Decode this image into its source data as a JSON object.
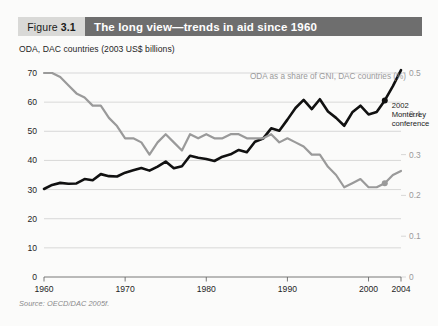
{
  "figure": {
    "number_prefix": "Figure",
    "number": "3.1",
    "title": "The long view—trends in aid since 1960",
    "subtitle": "ODA, DAC countries (2003 US$ billions)",
    "source": "Source: OECD/DAC 2005f.",
    "header_box_color": "#d9d9d7",
    "header_bar_color": "#6e6e6e",
    "header_text_color": "#ffffff"
  },
  "chart_data": {
    "type": "line",
    "title": "The long view—trends in aid since 1960",
    "xlabel": "",
    "ylabel": "ODA, DAC countries (2003 US$ billions)",
    "y2label": "ODA as a share of GNI, DAC countries (%)",
    "xlim": [
      1960,
      2004
    ],
    "ylim": [
      0,
      70
    ],
    "y2lim": [
      0,
      0.5
    ],
    "grid": true,
    "legend_position": "none",
    "xticks": [
      1960,
      1970,
      1980,
      1990,
      2000,
      2004
    ],
    "xtick_labels": [
      "1960",
      "1970",
      "1980",
      "1990",
      "2000",
      "2004"
    ],
    "yticks": [
      0,
      10,
      20,
      30,
      40,
      50,
      60,
      70
    ],
    "ytick_labels": [
      "0",
      "10",
      "20",
      "30",
      "40",
      "50",
      "60",
      "70"
    ],
    "y2ticks": [
      0,
      0.1,
      0.2,
      0.3,
      0.4,
      0.5
    ],
    "y2tick_labels": [
      "0",
      "0.1",
      "0.2",
      "0.3",
      "0.4",
      "0.5"
    ],
    "x": [
      1960,
      1961,
      1962,
      1963,
      1964,
      1965,
      1966,
      1967,
      1968,
      1969,
      1970,
      1971,
      1972,
      1973,
      1974,
      1975,
      1976,
      1977,
      1978,
      1979,
      1980,
      1981,
      1982,
      1983,
      1984,
      1985,
      1986,
      1987,
      1988,
      1989,
      1990,
      1991,
      1992,
      1993,
      1994,
      1995,
      1996,
      1997,
      1998,
      1999,
      2000,
      2001,
      2002,
      2003,
      2004
    ],
    "series": [
      {
        "name": "ODA, DAC countries (2003 US$ billions)",
        "axis": "left",
        "color": "#111111",
        "values": [
          30.2,
          31.6,
          32.3,
          32.0,
          32.1,
          33.6,
          33.2,
          35.3,
          34.6,
          34.5,
          35.8,
          36.6,
          37.4,
          36.5,
          37.9,
          39.6,
          37.3,
          38.0,
          41.6,
          40.9,
          40.5,
          39.8,
          41.3,
          42.1,
          43.6,
          42.8,
          46.4,
          47.5,
          51.0,
          50.2,
          54.0,
          58.0,
          60.8,
          57.6,
          61.0,
          56.8,
          54.6,
          51.9,
          56.5,
          58.8,
          55.8,
          56.6,
          60.6,
          65.5,
          71.0
        ]
      },
      {
        "name": "ODA as a share of GNI, DAC countries (%)",
        "axis": "right",
        "color": "#9a9a9a",
        "values": [
          0.5,
          0.5,
          0.49,
          0.47,
          0.45,
          0.44,
          0.42,
          0.42,
          0.39,
          0.37,
          0.34,
          0.34,
          0.33,
          0.3,
          0.33,
          0.35,
          0.33,
          0.31,
          0.35,
          0.34,
          0.35,
          0.34,
          0.34,
          0.35,
          0.35,
          0.34,
          0.34,
          0.34,
          0.35,
          0.33,
          0.34,
          0.33,
          0.32,
          0.3,
          0.3,
          0.27,
          0.25,
          0.22,
          0.23,
          0.24,
          0.22,
          0.22,
          0.23,
          0.25,
          0.26
        ]
      }
    ],
    "annotations": [
      {
        "name": "monterrey-conference",
        "lines": [
          "2002",
          "Monterrey",
          "conference"
        ],
        "x": 2002,
        "y": 60.6,
        "marker": true
      }
    ],
    "markers": [
      {
        "series": "ODA, DAC countries (2003 US$ billions)",
        "x": 2002,
        "y": 60.6,
        "color": "#111111"
      },
      {
        "series": "ODA as a share of GNI, DAC countries (%)",
        "x": 2002,
        "y": 0.23,
        "color": "#9a9a9a"
      }
    ]
  }
}
